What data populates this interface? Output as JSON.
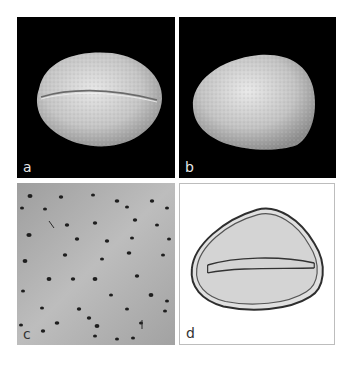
{
  "figure": {
    "panels": [
      {
        "id": "a",
        "label": "a",
        "description": "SEM image of pollen grain, equatorial view showing colpus (furrow) across middle",
        "background": "#000000"
      },
      {
        "id": "b",
        "label": "b",
        "description": "SEM image of pollen grain, polar/oblique view, rounded-triangular shape",
        "background": "#000000"
      },
      {
        "id": "c",
        "label": "c",
        "description": "SEM close-up of exine surface with scattered perforations",
        "background": "#a8a8a8"
      },
      {
        "id": "d",
        "label": "d",
        "description": "Light micrograph of pollen grain outline with central colpus",
        "background": "#ffffff"
      }
    ]
  }
}
